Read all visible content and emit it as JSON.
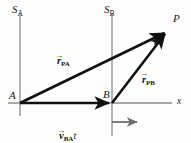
{
  "figure": {
    "background_color": "#fdfdfd",
    "width": 191,
    "height": 143
  },
  "colors": {
    "vector_black": "#111111",
    "axis_gray": "#8c8c8c",
    "velocity_arrow_gray": "#6e6e6e",
    "text": "#1a1a1a"
  },
  "frames": [
    {
      "id": "SA",
      "label_base": "S",
      "label_sub": "A",
      "axis_x": 20,
      "axis_top": 13,
      "axis_bottom": 116
    },
    {
      "id": "SB",
      "label_base": "S",
      "label_sub": "B",
      "axis_x": 112,
      "axis_top": 13,
      "axis_bottom": 136
    }
  ],
  "points": [
    {
      "id": "A",
      "label": "A",
      "x": 20,
      "y": 103
    },
    {
      "id": "B",
      "label": "B",
      "x": 112,
      "y": 103
    },
    {
      "id": "P",
      "label": "P",
      "x": 168,
      "y": 30
    }
  ],
  "axes": {
    "x_axis_label": "x",
    "x_axis_y": 103,
    "x_axis_start": 8,
    "x_axis_end": 172
  },
  "vectors": [
    {
      "id": "r_PA",
      "symbol": "r",
      "subscript": "PA",
      "suffix": "",
      "from": "A",
      "to": "P",
      "label_x": 57,
      "label_y": 56,
      "color": "#111111"
    },
    {
      "id": "r_PB",
      "symbol": "r",
      "subscript": "PB",
      "suffix": "",
      "from": "B",
      "to": "P",
      "label_x": 142,
      "label_y": 64,
      "color": "#111111"
    },
    {
      "id": "v_BA_t",
      "symbol": "v",
      "subscript": "BA",
      "suffix": "t",
      "from": "A",
      "to": "B",
      "label_x": 59,
      "label_y": 110,
      "color": "#111111"
    },
    {
      "id": "v_BA",
      "symbol": "v",
      "subscript": "BA",
      "suffix": "",
      "from": "B",
      "to": "velocity-arrow-end",
      "label_x": 143,
      "label_y": 117,
      "color": "#6e6e6e"
    }
  ],
  "velocity_arrow": {
    "start_x": 112,
    "start_y": 122,
    "end_x": 140,
    "end_y": 122
  },
  "arrow_glyph": "→"
}
